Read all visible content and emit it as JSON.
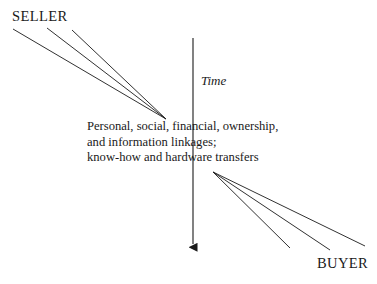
{
  "diagram": {
    "background_color": "#ffffff",
    "stroke_color": "#1a1a1a",
    "seller": {
      "label": "SELLER"
    },
    "buyer": {
      "label": "BUYER"
    },
    "time_axis": {
      "label": "Time",
      "direction": "downward"
    },
    "center_text": {
      "line1": "Personal, social, financial, ownership,",
      "line2": "and information linkages;",
      "line3": "know-how and hardware transfers"
    }
  }
}
